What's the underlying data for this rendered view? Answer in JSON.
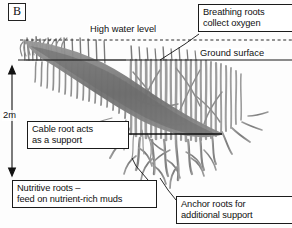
{
  "figure": {
    "panel_label": "B"
  },
  "lines": {
    "high_water_level": "High water level",
    "ground_surface": "Ground surface"
  },
  "scale": {
    "value": "2m"
  },
  "callouts": {
    "breathing": "Breathing roots\ncollect oxygen",
    "cable": "Cable root acts\nas a support",
    "nutritive": "Nutritive roots –\nfeed on nutrient-rich muds",
    "anchor": "Anchor roots for\nadditional support"
  },
  "colors": {
    "root_fill": "#8a8a8a",
    "root_dark": "#5d5d5d",
    "line": "#1b1b1b",
    "background": "#fdfdfd"
  }
}
